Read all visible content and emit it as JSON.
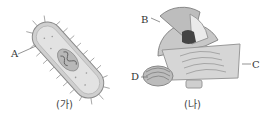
{
  "figures": [
    {
      "id": "ga",
      "caption": "(가)",
      "subject": "prokaryotic bacterium cell",
      "labels": [
        {
          "letter": "A"
        }
      ]
    },
    {
      "id": "na",
      "caption": "(나)",
      "subject": "eukaryotic organelles",
      "labels": [
        {
          "letter": "B"
        },
        {
          "letter": "C"
        },
        {
          "letter": "D"
        }
      ]
    }
  ],
  "colors": {
    "cell_fill": "#d8d8d8",
    "outline": "#888888",
    "dark": "#555555"
  }
}
